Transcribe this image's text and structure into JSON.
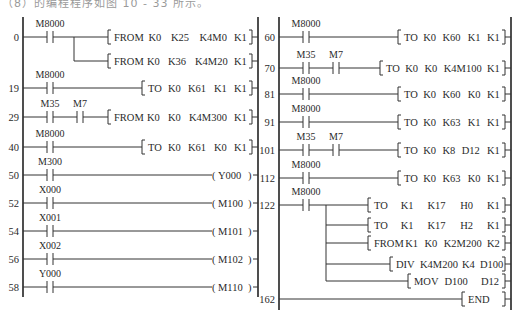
{
  "caption": "（8）的编程程序如图 10 - 33 所示。",
  "left_panel": {
    "rungs": [
      {
        "step": "0",
        "y": 37,
        "contacts": [
          {
            "label": "M8000",
            "x": 50
          }
        ],
        "outputs": [
          {
            "kind": "instr",
            "text": [
              "FROM",
              "K0",
              "K25",
              "K4M0",
              "K1"
            ],
            "x": 108,
            "y": 37
          },
          {
            "kind": "instr",
            "text": [
              "FROM",
              "K0",
              "K36",
              "K4M20",
              "K1"
            ],
            "x": 108,
            "y": 61
          }
        ],
        "branch_x": 74
      },
      {
        "step": "19",
        "y": 88,
        "contacts": [
          {
            "label": "M8000",
            "x": 50
          }
        ],
        "outputs": [
          {
            "kind": "instr",
            "text": [
              "TO",
              "K0",
              "K61",
              "K1",
              "K1"
            ],
            "x": 142,
            "y": 88
          }
        ]
      },
      {
        "step": "29",
        "y": 117,
        "contacts": [
          {
            "label": "M35",
            "x": 50
          },
          {
            "label": "M7",
            "x": 80
          }
        ],
        "outputs": [
          {
            "kind": "instr",
            "text": [
              "FROM",
              "K0",
              "K0",
              "K4M300",
              "K1"
            ],
            "x": 108,
            "y": 117
          }
        ]
      },
      {
        "step": "40",
        "y": 147,
        "contacts": [
          {
            "label": "M8000",
            "x": 50
          }
        ],
        "outputs": [
          {
            "kind": "instr",
            "text": [
              "TO",
              "K0",
              "K61",
              "K0",
              "K1"
            ],
            "x": 142,
            "y": 147
          }
        ]
      },
      {
        "step": "50",
        "y": 175,
        "contacts": [
          {
            "label": "M300",
            "x": 50
          }
        ],
        "outputs": [
          {
            "kind": "coil",
            "text": [
              "Y000"
            ],
            "x": 212,
            "y": 175
          }
        ]
      },
      {
        "step": "52",
        "y": 203,
        "contacts": [
          {
            "label": "X000",
            "x": 50
          }
        ],
        "outputs": [
          {
            "kind": "coil",
            "text": [
              "M100"
            ],
            "x": 212,
            "y": 203
          }
        ]
      },
      {
        "step": "54",
        "y": 231,
        "contacts": [
          {
            "label": "X001",
            "x": 50
          }
        ],
        "outputs": [
          {
            "kind": "coil",
            "text": [
              "M101"
            ],
            "x": 212,
            "y": 231
          }
        ]
      },
      {
        "step": "56",
        "y": 259,
        "contacts": [
          {
            "label": "X002",
            "x": 50
          }
        ],
        "outputs": [
          {
            "kind": "coil",
            "text": [
              "M102"
            ],
            "x": 212,
            "y": 259
          }
        ]
      },
      {
        "step": "58",
        "y": 287,
        "contacts": [
          {
            "label": "Y000",
            "x": 50
          }
        ],
        "outputs": [
          {
            "kind": "coil",
            "text": [
              "M110"
            ],
            "x": 212,
            "y": 287
          }
        ]
      }
    ]
  },
  "right_panel": {
    "rungs": [
      {
        "step": "60",
        "y": 37,
        "contacts": [
          {
            "label": "M8000",
            "x": 306
          }
        ],
        "outputs": [
          {
            "kind": "instr",
            "text": [
              "TO",
              "K0",
              "K60",
              "K1",
              "K1"
            ],
            "x": 398,
            "y": 37
          }
        ]
      },
      {
        "step": "70",
        "y": 68,
        "contacts": [
          {
            "label": "M35",
            "x": 306
          },
          {
            "label": "M7",
            "x": 336
          }
        ],
        "outputs": [
          {
            "kind": "instr",
            "text": [
              "TO",
              "K0",
              "K0",
              "K4M100",
              "K1"
            ],
            "x": 380,
            "y": 68
          }
        ]
      },
      {
        "step": "81",
        "y": 94,
        "contacts": [
          {
            "label": "M8000",
            "x": 306
          }
        ],
        "outputs": [
          {
            "kind": "instr",
            "text": [
              "TO",
              "K0",
              "K60",
              "K0",
              "K1"
            ],
            "x": 398,
            "y": 94
          }
        ]
      },
      {
        "step": "91",
        "y": 122,
        "contacts": [
          {
            "label": "M8000",
            "x": 306
          }
        ],
        "outputs": [
          {
            "kind": "instr",
            "text": [
              "TO",
              "K0",
              "K63",
              "K1",
              "K1"
            ],
            "x": 398,
            "y": 122
          }
        ]
      },
      {
        "step": "101",
        "y": 150,
        "contacts": [
          {
            "label": "M35",
            "x": 306
          },
          {
            "label": "M7",
            "x": 336
          }
        ],
        "outputs": [
          {
            "kind": "instr",
            "text": [
              "TO",
              "K0",
              "K8",
              "D12",
              "K1"
            ],
            "x": 398,
            "y": 150
          }
        ]
      },
      {
        "step": "112",
        "y": 178,
        "contacts": [
          {
            "label": "M8000",
            "x": 306
          }
        ],
        "outputs": [
          {
            "kind": "instr",
            "text": [
              "TO",
              "K0",
              "K63",
              "K0",
              "K1"
            ],
            "x": 398,
            "y": 178
          }
        ]
      },
      {
        "step": "122",
        "y": 205,
        "contacts": [
          {
            "label": "M8000",
            "x": 306
          }
        ],
        "branch_x": 326,
        "outputs": [
          {
            "kind": "instr",
            "text": [
              "TO",
              "K1",
              "K17",
              "H0",
              "K1"
            ],
            "x": 368,
            "y": 205
          },
          {
            "kind": "instr",
            "text": [
              "TO",
              "K1",
              "K17",
              "H2",
              "K1"
            ],
            "x": 368,
            "y": 225
          },
          {
            "kind": "instr",
            "text": [
              "FROM",
              "K1",
              "K0",
              "K2M200",
              "K2"
            ],
            "x": 368,
            "y": 243
          },
          {
            "kind": "instr",
            "text": [
              "DIV",
              "K4M200",
              "K4",
              "D100"
            ],
            "x": 390,
            "y": 264
          },
          {
            "kind": "instr",
            "text": [
              "MOV",
              "D100",
              "D12"
            ],
            "x": 408,
            "y": 281
          }
        ]
      },
      {
        "step": "162",
        "y": 299,
        "contacts": [],
        "outputs": [
          {
            "kind": "instr",
            "text": [
              "END"
            ],
            "x": 462,
            "y": 299
          }
        ]
      }
    ]
  }
}
